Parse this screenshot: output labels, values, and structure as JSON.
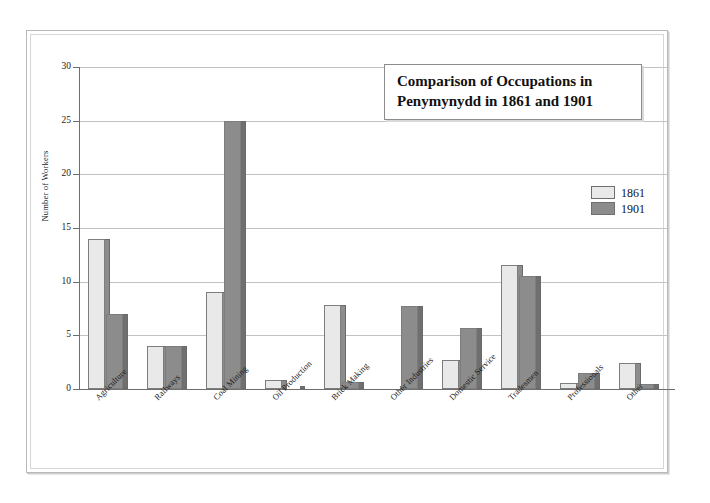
{
  "chart_data": {
    "type": "bar",
    "title": "Comparison of Occupations in Penymynydd in 1861 and 1901",
    "title_lines": [
      "Comparison of Occupations in",
      "Penymynydd in 1861 and 1901"
    ],
    "xlabel": "",
    "ylabel": "Number of Workers",
    "ylim": [
      0,
      30
    ],
    "ytick_step": 5,
    "yticks": [
      0,
      5,
      10,
      15,
      20,
      25,
      30
    ],
    "ytick_labels": [
      "0",
      "5",
      "10",
      "15",
      "20",
      "25",
      "30"
    ],
    "grid": true,
    "legend_position": "upper right",
    "categories": [
      "Agriculture",
      "Railways",
      "Coal Mining",
      "Oil Production",
      "Brick Making",
      "Other Industries",
      "Domestic Service",
      "Tradesmen",
      "Professionals",
      "Other"
    ],
    "series": [
      {
        "name": "1861",
        "color": "#e9e9e9",
        "values": [
          14,
          4,
          9,
          0.8,
          7.8,
          0,
          2.7,
          11.6,
          0.6,
          2.4
        ]
      },
      {
        "name": "1901",
        "color": "#8c8c8c",
        "values": [
          7,
          4,
          25,
          0,
          0.7,
          7.7,
          5.7,
          10.5,
          1.5,
          0.5
        ]
      }
    ]
  },
  "legend": {
    "entries": [
      {
        "label": "1861",
        "swatch": "s1861"
      },
      {
        "label": "1901",
        "swatch": "s1901"
      }
    ]
  },
  "colors": {
    "series_1861": "#e9e9e9",
    "series_1901": "#8c8c8c",
    "axis": "#6e6e6e",
    "grid": "#c2c2c2",
    "frame": "#b9b9b9",
    "text": "#1a1a1a"
  }
}
